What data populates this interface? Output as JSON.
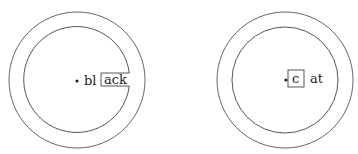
{
  "diagram": {
    "stroke_color": "#555555",
    "left": {
      "label_outside_box": "bl",
      "label_inside_box": "ack"
    },
    "right": {
      "label_inside_box": "c",
      "label_outside_box": "at"
    }
  }
}
